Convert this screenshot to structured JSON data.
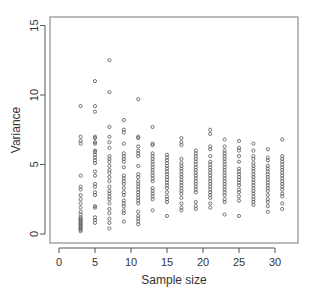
{
  "chart_data": {
    "type": "scatter",
    "title": "",
    "xlabel": "Sample size",
    "ylabel": "Variance",
    "xlim": [
      -1,
      33.5
    ],
    "ylim": [
      -0.6,
      15.6
    ],
    "xticks": [
      0,
      5,
      10,
      15,
      20,
      25,
      30
    ],
    "yticks": [
      0,
      5,
      10,
      15
    ],
    "grid": false,
    "legend": null,
    "marker": "open-circle",
    "series": [
      {
        "name": "variance",
        "points": [
          {
            "x": 3,
            "y": [
              0.2,
              0.3,
              0.4,
              0.5,
              0.6,
              0.7,
              0.8,
              0.9,
              1.0,
              1.1,
              1.2,
              1.4,
              1.6,
              1.9,
              2.2,
              2.5,
              2.8,
              3.2,
              3.4,
              4.2,
              6.5,
              6.7,
              7.0,
              9.2
            ]
          },
          {
            "x": 5,
            "y": [
              0.8,
              1.0,
              1.2,
              1.9,
              2.0,
              2.8,
              3.0,
              3.4,
              3.6,
              4.2,
              4.5,
              5.1,
              5.3,
              5.5,
              5.7,
              5.9,
              6.0,
              6.5,
              6.6,
              6.9,
              7.0,
              8.8,
              9.2,
              11.0
            ]
          },
          {
            "x": 7,
            "y": [
              0.4,
              0.8,
              1.1,
              1.5,
              1.8,
              2.2,
              2.5,
              2.7,
              2.9,
              3.1,
              3.4,
              3.8,
              4.1,
              4.4,
              4.6,
              4.9,
              5.2,
              5.4,
              5.6,
              6.2,
              6.6,
              7.0,
              7.7,
              10.2,
              12.5
            ]
          },
          {
            "x": 9,
            "y": [
              0.9,
              1.5,
              1.7,
              2.0,
              2.2,
              2.4,
              2.8,
              3.0,
              3.3,
              3.6,
              3.8,
              4.0,
              4.2,
              4.8,
              5.2,
              5.4,
              5.6,
              5.8,
              6.5,
              7.3,
              7.5,
              8.2
            ]
          },
          {
            "x": 11,
            "y": [
              0.7,
              0.9,
              1.1,
              1.3,
              1.6,
              2.2,
              2.4,
              2.6,
              2.8,
              3.0,
              3.2,
              3.4,
              3.6,
              3.8,
              4.1,
              4.3,
              4.9,
              5.6,
              5.8,
              6.0,
              6.3,
              6.9,
              7.0,
              9.7
            ]
          },
          {
            "x": 13,
            "y": [
              1.7,
              2.5,
              2.7,
              2.9,
              3.1,
              3.3,
              3.8,
              4.0,
              4.2,
              4.4,
              4.6,
              4.8,
              5.0,
              5.2,
              5.4,
              5.6,
              5.8,
              6.4,
              6.5,
              7.7
            ]
          },
          {
            "x": 15,
            "y": [
              1.3,
              2.3,
              2.5,
              2.7,
              3.0,
              3.3,
              3.5,
              3.7,
              3.9,
              4.1,
              4.3,
              4.5,
              4.7,
              4.9,
              5.1,
              5.3,
              5.5,
              5.7
            ]
          },
          {
            "x": 17,
            "y": [
              1.7,
              1.9,
              2.2,
              2.6,
              2.9,
              3.1,
              3.3,
              3.5,
              3.7,
              3.9,
              4.1,
              4.3,
              4.5,
              4.7,
              4.9,
              5.1,
              5.4,
              6.4,
              6.6,
              6.9
            ]
          },
          {
            "x": 19,
            "y": [
              1.8,
              2.0,
              2.3,
              3.0,
              3.2,
              3.4,
              3.6,
              3.8,
              4.0,
              4.2,
              4.4,
              4.6,
              4.8,
              5.0,
              5.2,
              5.4,
              5.6,
              5.8,
              6.0
            ]
          },
          {
            "x": 21,
            "y": [
              1.9,
              2.2,
              2.6,
              2.8,
              3.0,
              3.2,
              3.4,
              3.6,
              3.8,
              4.0,
              4.2,
              4.4,
              4.6,
              4.8,
              5.0,
              5.2,
              5.6,
              6.1,
              6.3,
              7.2,
              7.5
            ]
          },
          {
            "x": 23,
            "y": [
              1.4,
              2.3,
              2.5,
              2.8,
              3.0,
              3.2,
              3.4,
              3.6,
              3.8,
              4.0,
              4.2,
              4.4,
              4.6,
              4.8,
              5.0,
              5.2,
              5.4,
              5.6,
              5.8,
              6.0,
              6.3,
              6.8
            ]
          },
          {
            "x": 25,
            "y": [
              1.3,
              2.4,
              2.7,
              3.0,
              3.2,
              3.5,
              3.7,
              3.9,
              4.1,
              4.3,
              4.5,
              4.7,
              5.2,
              5.6,
              6.0,
              6.2,
              6.7
            ]
          },
          {
            "x": 27,
            "y": [
              2.1,
              2.3,
              2.5,
              2.7,
              2.9,
              3.1,
              3.3,
              3.5,
              3.7,
              3.9,
              4.1,
              4.3,
              4.5,
              4.7,
              4.9,
              5.1,
              5.4,
              5.6,
              6.0,
              6.5
            ]
          },
          {
            "x": 29,
            "y": [
              1.6,
              2.0,
              2.3,
              2.5,
              2.8,
              3.1,
              3.3,
              3.5,
              3.7,
              3.9,
              4.1,
              4.3,
              4.5,
              4.7,
              4.9,
              5.3,
              5.5,
              6.1
            ]
          },
          {
            "x": 31,
            "y": [
              1.8,
              2.2,
              2.7,
              2.9,
              3.2,
              3.4,
              3.6,
              3.8,
              4.0,
              4.2,
              4.4,
              4.6,
              4.8,
              5.0,
              5.2,
              5.4,
              5.6,
              6.8
            ]
          }
        ]
      }
    ],
    "colors": {
      "marker": "#555555",
      "axis": "#555555",
      "text": "#333333",
      "background": "#ffffff"
    }
  }
}
